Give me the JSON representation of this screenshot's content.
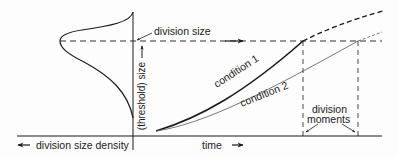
{
  "diagram": {
    "title": "",
    "labels": {
      "division_size": "division size",
      "threshold_size": "(threshold) size",
      "condition_1": "condition 1",
      "condition_2": "condition 2",
      "division_moments_line1": "division",
      "division_moments_line2": "moments",
      "time": "time",
      "division_size_density": "division size density"
    },
    "icons": {
      "arrow_right": "arrow-right-icon",
      "arrow_left": "arrow-left-icon",
      "arrow_up": "arrow-up-icon"
    },
    "colors": {
      "line": "#1a1a1a",
      "background": "#fdfdfd",
      "condition_2_line": "#555555"
    }
  }
}
